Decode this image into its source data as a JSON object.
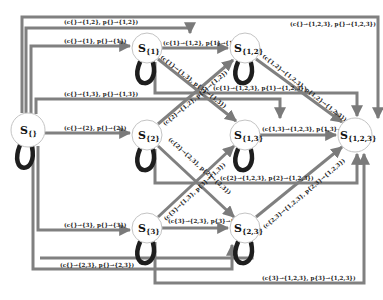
{
  "diagram": {
    "title": "",
    "nodes": [
      {
        "id": "empty",
        "label": "S",
        "sub": "{}",
        "x": 28,
        "y": 130,
        "r": 17
      },
      {
        "id": "s1",
        "label": "S",
        "sub": "{1}",
        "x": 147,
        "y": 48,
        "r": 15
      },
      {
        "id": "s2",
        "label": "S",
        "sub": "{2}",
        "x": 147,
        "y": 135,
        "r": 15
      },
      {
        "id": "s3",
        "label": "S",
        "sub": "{3}",
        "x": 147,
        "y": 228,
        "r": 15
      },
      {
        "id": "s12",
        "label": "S",
        "sub": "{1,2}",
        "x": 245,
        "y": 48,
        "r": 15
      },
      {
        "id": "s13",
        "label": "S",
        "sub": "{1,3}",
        "x": 245,
        "y": 135,
        "r": 15
      },
      {
        "id": "s23",
        "label": "S",
        "sub": "{2,3}",
        "x": 245,
        "y": 228,
        "r": 15
      },
      {
        "id": "s123",
        "label": "S",
        "sub": "{1,2,3}",
        "x": 355,
        "y": 135,
        "r": 17
      }
    ],
    "edge_labels": {
      "e_empty_1": "(c{}→{1}, p{}→{1})",
      "e_empty_2": "(c{}→{2}, p{}→{2})",
      "e_empty_3": "(c{}→{3}, p{}→{3})",
      "e_empty_12": "(c{}→{1,2}, p{}→{1,2})",
      "e_empty_13": "(c{}→{1,3}, p{}→{1,3})",
      "e_empty_23": "(c{}→{2,3}, p{}→{2,3})",
      "e_empty_123": "(c{}→{1,2,3}, p{}→{1,2,3})",
      "e_1_12": "(c{1}→{1,2}, p{1}→{1,2})",
      "e_1_13": "(c{1}→{1,3}, p{1}→{1,3})",
      "e_1_123": "(c{1}→{1,2,3}, p{1}→{1,2,3})",
      "e_2_12": "(c{2}→{1,2}, p{2}→{1,2})",
      "e_2_23": "(c{2}→{2,3}, p{2}→{2,3})",
      "e_2_123": "(c{2}→{1,2,3}, p{2}→{1,2,3})",
      "e_3_13": "(c{3}→{1,3}, p{3}→{1,3})",
      "e_3_23": "(c{3}→{2,3}, p{3}→{2,3})",
      "e_3_123": "(c{3}→{1,2,3}, p{3}→{1,2,3})",
      "e_12_123": "(c{1,2}→{1,2,3}, p{1,2}→{1,2,3})",
      "e_13_123": "(c{1,3}→{1,2,3}, p{1,3}→{1,2,3})",
      "e_23_123": "(c{2,3}→{1,2,3}, p{2,3}→{1,2,3})"
    },
    "colors": {
      "edge": "#808080",
      "loop": "#1e1e1e",
      "node_border": "#c4c4c4"
    }
  }
}
